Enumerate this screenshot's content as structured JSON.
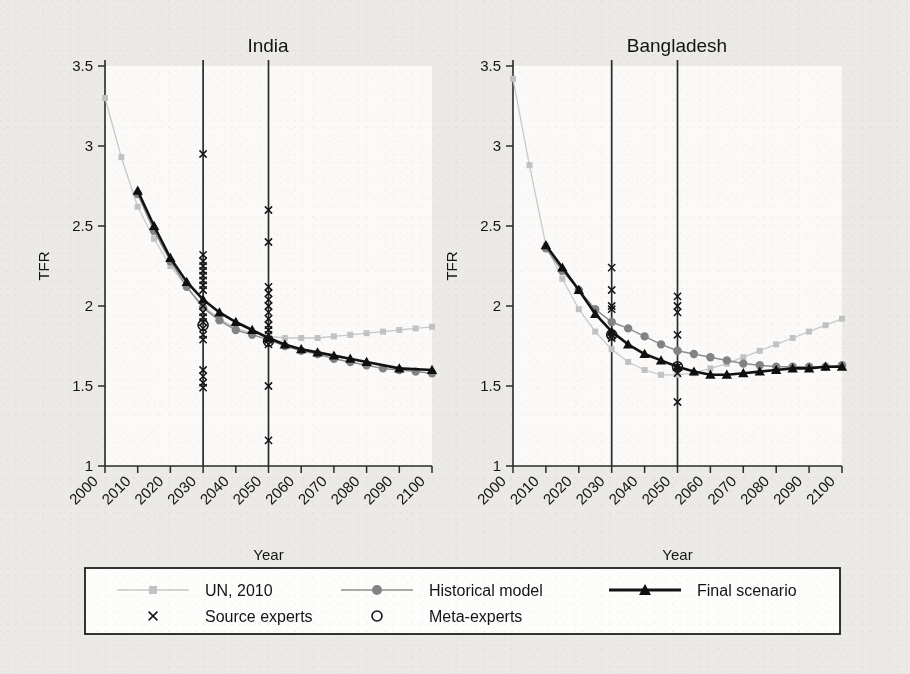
{
  "figure": {
    "background_color": "#eceae7",
    "panel_background": "#fbfaf9"
  },
  "chart_data": [
    {
      "type": "line",
      "title": "India",
      "xlabel": "Year",
      "ylabel": "TFR",
      "xlim": [
        2000,
        2100
      ],
      "ylim": [
        1,
        3.5
      ],
      "ytick_labels": [
        "3.5",
        "3",
        "2.5",
        "2",
        "1.5",
        "1"
      ],
      "yticks": [
        3.5,
        3,
        2.5,
        2,
        1.5,
        1
      ],
      "xtick_labels": [
        "2000",
        "2010",
        "2020",
        "2030",
        "2040",
        "2050",
        "2060",
        "2070",
        "2080",
        "2090",
        "2100"
      ],
      "xticks": [
        2000,
        2010,
        2020,
        2030,
        2040,
        2050,
        2060,
        2070,
        2080,
        2090,
        2100
      ],
      "grid": false,
      "reference_lines": [
        2030,
        2050
      ],
      "series": [
        {
          "name": "UN, 2010",
          "marker": "square",
          "color": "#c2c2c2",
          "x": [
            2000,
            2005,
            2010,
            2015,
            2020,
            2025,
            2030,
            2035,
            2040,
            2045,
            2050,
            2055,
            2060,
            2065,
            2070,
            2075,
            2080,
            2085,
            2090,
            2095,
            2100
          ],
          "values": [
            3.3,
            2.93,
            2.62,
            2.42,
            2.25,
            2.12,
            2.0,
            1.92,
            1.86,
            1.83,
            1.81,
            1.8,
            1.8,
            1.8,
            1.81,
            1.82,
            1.83,
            1.84,
            1.85,
            1.86,
            1.87
          ]
        },
        {
          "name": "Historical model",
          "marker": "circle",
          "color": "#838383",
          "x": [
            2010,
            2015,
            2020,
            2025,
            2030,
            2035,
            2040,
            2045,
            2050,
            2055,
            2060,
            2065,
            2070,
            2075,
            2080,
            2085,
            2090,
            2095,
            2100
          ],
          "values": [
            2.7,
            2.47,
            2.28,
            2.12,
            1.99,
            1.91,
            1.85,
            1.82,
            1.79,
            1.75,
            1.72,
            1.7,
            1.67,
            1.65,
            1.63,
            1.61,
            1.6,
            1.59,
            1.58
          ]
        },
        {
          "name": "Final scenario",
          "marker": "triangle",
          "color": "#0f0f0f",
          "x": [
            2010,
            2015,
            2020,
            2025,
            2030,
            2035,
            2040,
            2045,
            2050,
            2055,
            2060,
            2065,
            2070,
            2075,
            2080,
            2090,
            2100
          ],
          "values": [
            2.72,
            2.5,
            2.3,
            2.15,
            2.04,
            1.96,
            1.9,
            1.85,
            1.8,
            1.76,
            1.73,
            1.71,
            1.69,
            1.67,
            1.65,
            1.61,
            1.6
          ]
        }
      ],
      "source_experts": [
        {
          "year": 2030,
          "values": [
            2.95,
            2.32,
            2.28,
            2.25,
            2.22,
            2.19,
            2.16,
            2.13,
            2.1,
            2.0,
            1.96,
            1.93,
            1.9,
            1.86,
            1.82,
            1.79,
            1.6,
            1.56,
            1.52,
            1.49
          ]
        },
        {
          "year": 2050,
          "values": [
            2.6,
            2.4,
            2.12,
            2.08,
            2.04,
            2.0,
            1.96,
            1.92,
            1.88,
            1.85,
            1.82,
            1.79,
            1.76,
            1.5,
            1.16
          ]
        }
      ],
      "meta_experts": [
        {
          "year": 2030,
          "value": 1.88
        },
        {
          "year": 2050,
          "value": 1.78
        }
      ]
    },
    {
      "type": "line",
      "title": "Bangladesh",
      "xlabel": "Year",
      "ylabel": "TFR",
      "xlim": [
        2000,
        2100
      ],
      "ylim": [
        1,
        3.5
      ],
      "ytick_labels": [
        "3.5",
        "3",
        "2.5",
        "2",
        "1.5",
        "1"
      ],
      "yticks": [
        3.5,
        3,
        2.5,
        2,
        1.5,
        1
      ],
      "xtick_labels": [
        "2000",
        "2010",
        "2020",
        "2030",
        "2040",
        "2050",
        "2060",
        "2070",
        "2080",
        "2090",
        "2100"
      ],
      "xticks": [
        2000,
        2010,
        2020,
        2030,
        2040,
        2050,
        2060,
        2070,
        2080,
        2090,
        2100
      ],
      "grid": false,
      "reference_lines": [
        2030,
        2050
      ],
      "series": [
        {
          "name": "UN, 2010",
          "marker": "square",
          "color": "#c2c2c2",
          "x": [
            2000,
            2005,
            2010,
            2015,
            2020,
            2025,
            2030,
            2035,
            2040,
            2045,
            2050,
            2055,
            2060,
            2065,
            2070,
            2075,
            2080,
            2085,
            2090,
            2095,
            2100
          ],
          "values": [
            3.42,
            2.88,
            2.38,
            2.17,
            1.98,
            1.84,
            1.73,
            1.65,
            1.6,
            1.57,
            1.57,
            1.58,
            1.61,
            1.64,
            1.68,
            1.72,
            1.76,
            1.8,
            1.84,
            1.88,
            1.92
          ]
        },
        {
          "name": "Historical model",
          "marker": "circle",
          "color": "#838383",
          "x": [
            2010,
            2015,
            2020,
            2025,
            2030,
            2035,
            2040,
            2045,
            2050,
            2055,
            2060,
            2065,
            2070,
            2075,
            2080,
            2085,
            2090,
            2095,
            2100
          ],
          "values": [
            2.36,
            2.22,
            2.1,
            1.98,
            1.9,
            1.86,
            1.81,
            1.76,
            1.72,
            1.7,
            1.68,
            1.66,
            1.64,
            1.63,
            1.62,
            1.62,
            1.62,
            1.62,
            1.63
          ]
        },
        {
          "name": "Final scenario",
          "marker": "triangle",
          "color": "#0f0f0f",
          "x": [
            2010,
            2015,
            2020,
            2025,
            2030,
            2035,
            2040,
            2045,
            2050,
            2055,
            2060,
            2065,
            2070,
            2075,
            2080,
            2085,
            2090,
            2095,
            2100
          ],
          "values": [
            2.38,
            2.24,
            2.1,
            1.95,
            1.84,
            1.76,
            1.7,
            1.66,
            1.62,
            1.59,
            1.57,
            1.57,
            1.58,
            1.59,
            1.6,
            1.61,
            1.61,
            1.62,
            1.62
          ]
        }
      ],
      "source_experts": [
        {
          "year": 2030,
          "values": [
            2.24,
            2.1,
            2.0,
            1.98,
            1.82,
            1.8
          ]
        },
        {
          "year": 2050,
          "values": [
            2.06,
            2.0,
            1.96,
            1.82,
            1.62,
            1.58,
            1.4
          ]
        }
      ],
      "meta_experts": [
        {
          "year": 2030,
          "value": 1.82
        },
        {
          "year": 2050,
          "value": 1.62
        }
      ]
    }
  ],
  "legend": {
    "entries": [
      {
        "label": "UN, 2010",
        "marker": "square",
        "style": "line-marker",
        "color": "#c2c2c2"
      },
      {
        "label": "Historical model",
        "marker": "circle",
        "style": "line-marker",
        "color": "#838383"
      },
      {
        "label": "Final scenario",
        "marker": "triangle",
        "style": "line-marker",
        "color": "#0f0f0f"
      },
      {
        "label": "Source experts",
        "marker": "x",
        "style": "marker-only",
        "color": "#151515"
      },
      {
        "label": "Meta-experts",
        "marker": "o",
        "style": "marker-only",
        "color": "#151515"
      }
    ]
  }
}
